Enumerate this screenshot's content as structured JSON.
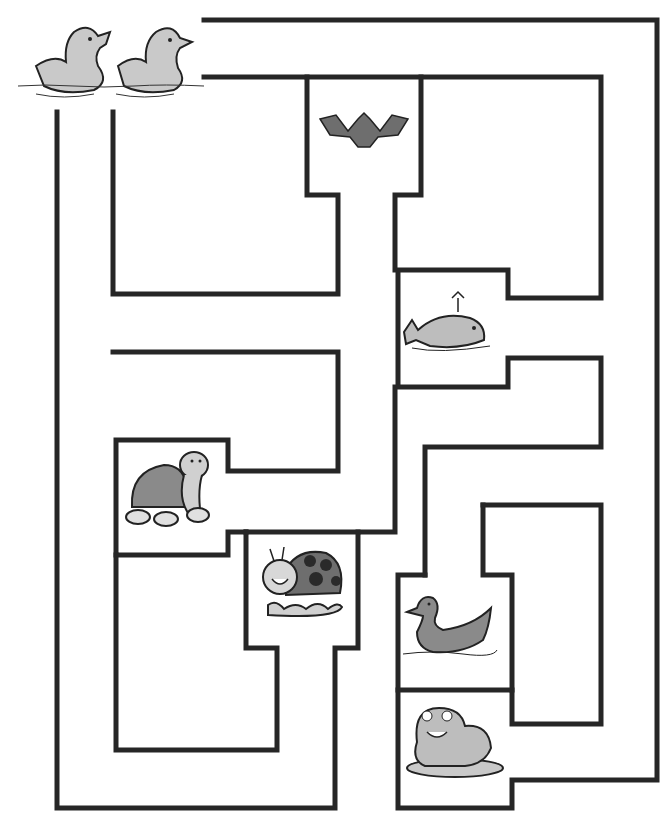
{
  "worksheet": {
    "type": "maze",
    "start": {
      "label": "Two ducklings",
      "icon": "duckling-icon"
    },
    "colors": {
      "wall": "#262626",
      "fill": "#bdbdbd",
      "dark_fill": "#6e6e6e",
      "background": "#ffffff"
    },
    "animals": [
      {
        "name": "bat",
        "icon": "bat-icon"
      },
      {
        "name": "whale",
        "icon": "whale-icon"
      },
      {
        "name": "turtle",
        "icon": "turtle-icon"
      },
      {
        "name": "ladybug",
        "icon": "ladybug-icon"
      },
      {
        "name": "duck",
        "icon": "duck-icon"
      },
      {
        "name": "frog",
        "icon": "frog-icon"
      }
    ]
  }
}
